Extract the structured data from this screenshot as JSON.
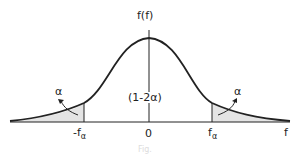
{
  "diagram": {
    "type": "symmetric probability density curve with two shaded tails",
    "y_axis_label": "f(f)",
    "x_axis_label": "f",
    "center_label": "(1-2α)",
    "origin_label": "0",
    "left_critical": {
      "main": "-f",
      "sub": "α"
    },
    "right_critical": {
      "main": "f",
      "sub": "α"
    },
    "left_tail_label": "α",
    "right_tail_label": "α",
    "caption": "Fig."
  },
  "colors": {
    "curve": "#222222",
    "shade": "#e4e4e4",
    "axis": "#222222",
    "caption": "#dddddd"
  }
}
